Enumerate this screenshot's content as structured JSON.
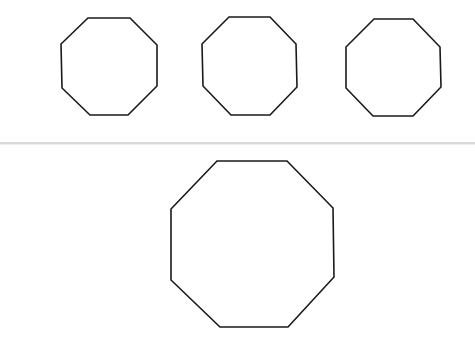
{
  "figure": {
    "background": "#ffffff",
    "stroke_color": "#1a1a1a",
    "stroke_width": 1.6,
    "separator_color": "#d9d9d9"
  },
  "top_row": {
    "shapes": [
      {
        "name": "octagon-1",
        "points": "88,18 130,18 157,45 157,86 128,115 90,115 62,88 61,44"
      },
      {
        "name": "octagon-2",
        "points": "229,17 270,17 296,44 297,87 270,115 231,115 203,86 202,44"
      },
      {
        "name": "octagon-3",
        "points": "374,19 413,19 440,47 441,87 413,116 373,116 346,88 346,47"
      }
    ]
  },
  "bottom_row": {
    "shapes": [
      {
        "name": "octagon-large",
        "points": "217,161 287,161 333,208 334,277 288,327 220,327 171,280 171,209"
      }
    ]
  }
}
